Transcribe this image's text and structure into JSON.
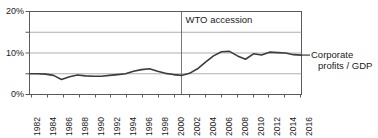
{
  "chart_data": {
    "type": "line",
    "title": "",
    "xlabel": "",
    "ylabel": "",
    "xlim": [
      1982,
      2016
    ],
    "ylim": [
      0,
      20
    ],
    "grid": true,
    "grid_values": [
      0,
      5,
      10,
      15,
      20
    ],
    "ytick_labels": [
      "20%",
      "10%",
      "0%"
    ],
    "ytick_values": [
      20,
      10,
      0
    ],
    "legend_position": "right-inline",
    "x": [
      1982,
      1983,
      1984,
      1985,
      1986,
      1987,
      1988,
      1989,
      1990,
      1991,
      1992,
      1993,
      1994,
      1995,
      1996,
      1997,
      1998,
      1999,
      2000,
      2001,
      2002,
      2003,
      2004,
      2005,
      2006,
      2007,
      2008,
      2009,
      2010,
      2011,
      2012,
      2013,
      2014,
      2015,
      2016
    ],
    "xtick_labels": [
      "1982",
      "1984",
      "1986",
      "1988",
      "1990",
      "1992",
      "1994",
      "1996",
      "1998",
      "2000",
      "2002",
      "2004",
      "2006",
      "2008",
      "2010",
      "2012",
      "2014",
      "2016"
    ],
    "series": [
      {
        "name": "Corporate profits / GDP",
        "color": "#3c3c3c",
        "values": [
          5.0,
          5.0,
          4.9,
          4.6,
          3.6,
          4.3,
          4.7,
          4.5,
          4.4,
          4.4,
          4.6,
          4.8,
          5.0,
          5.6,
          6.0,
          6.2,
          5.6,
          5.1,
          4.8,
          4.6,
          5.1,
          6.2,
          7.8,
          9.3,
          10.3,
          10.4,
          9.3,
          8.5,
          9.8,
          9.5,
          10.2,
          10.1,
          10.0,
          9.6,
          9.5
        ]
      }
    ],
    "annotations": [
      {
        "name": "wto-accession",
        "text": "WTO accession",
        "x_value": 2001,
        "type": "vertical-line-with-label"
      }
    ],
    "series_label_line1": "Corporate",
    "series_label_line2": "profits / GDP"
  }
}
